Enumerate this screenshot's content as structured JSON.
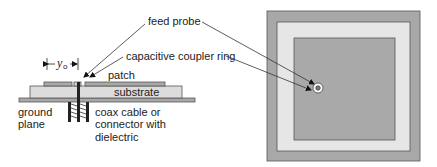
{
  "labels": {
    "feed_probe": "feed probe",
    "coupler_ring": "capacitive coupler ring",
    "patch": "patch",
    "substrate": "substrate",
    "ground_line1": "ground",
    "ground_line2": "plane",
    "coax_line1": "coax cable or",
    "coax_line2": "connector with",
    "coax_line3": "dielectric",
    "dim_symbol": "y",
    "dim_subscript": "o"
  },
  "colors": {
    "ground_plane": "#a8a8a8",
    "substrate": "#dcdcdc",
    "patch": "#a9a9a9",
    "outline": "#555555",
    "leader": "#333333",
    "coax": "#222222"
  }
}
